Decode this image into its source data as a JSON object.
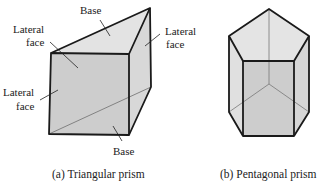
{
  "figure": {
    "triangular": {
      "caption": "(a) Triangular prism",
      "labels": {
        "base_top": "Base",
        "lateral_left_top_1": "Lateral",
        "lateral_left_top_2": "face",
        "lateral_right_1": "Lateral",
        "lateral_right_2": "face",
        "lateral_left_bottom_1": "Lateral",
        "lateral_left_bottom_2": "face",
        "base_bottom": "Base"
      }
    },
    "pentagonal": {
      "caption": "(b) Pentagonal prism"
    },
    "colors": {
      "edge": "#1a1a1a",
      "hidden_edge": "#777777",
      "front_face": "#cdcdcd",
      "top_face": "#e3e3e3",
      "side_face": "#d6d6d6"
    }
  }
}
